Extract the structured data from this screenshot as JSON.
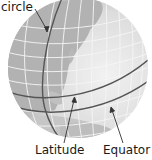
{
  "figure": {
    "labels": {
      "circle": "circle",
      "latitude": "Latitude",
      "equator": "Equator"
    }
  },
  "colors": {
    "background": "#ffffff",
    "ocean": "#e4e4e4",
    "land": "#b4b4b4",
    "grid": "#f4f4f4",
    "great_circle_line": "#555555",
    "text": "#1a1a1a"
  }
}
